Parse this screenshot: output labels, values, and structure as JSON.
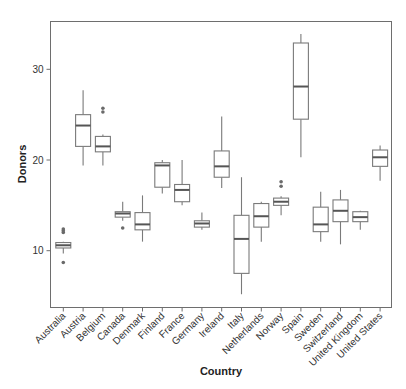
{
  "chart_data": {
    "type": "box",
    "title": "",
    "xlabel": "Country",
    "ylabel": "Donors",
    "ylim": [
      3.5,
      35.2
    ],
    "yticks": [
      10,
      20,
      30
    ],
    "grid": false,
    "legend": null,
    "categories": [
      "Australia",
      "Austria",
      "Belgium",
      "Canada",
      "Denmark",
      "Finland",
      "France",
      "Germany",
      "Ireland",
      "Italy",
      "Netherlands",
      "Norway",
      "Spain",
      "Sweden",
      "Switzerland",
      "United Kingdom",
      "United States"
    ],
    "boxes": [
      {
        "category": "Australia",
        "whisker_low": 9.7,
        "q1": 10.3,
        "median": 10.6,
        "q3": 10.9,
        "whisker_high": 11.0,
        "outliers": [
          8.7,
          12.0,
          12.2,
          12.4
        ]
      },
      {
        "category": "Austria",
        "whisker_low": 19.4,
        "q1": 21.5,
        "median": 23.8,
        "q3": 25.0,
        "whisker_high": 27.7,
        "outliers": []
      },
      {
        "category": "Belgium",
        "whisker_low": 19.4,
        "q1": 20.9,
        "median": 21.5,
        "q3": 22.6,
        "whisker_high": 22.8,
        "outliers": [
          25.3,
          25.7
        ]
      },
      {
        "category": "Canada",
        "whisker_low": 13.3,
        "q1": 13.7,
        "median": 14.1,
        "q3": 14.3,
        "whisker_high": 15.4,
        "outliers": [
          12.5
        ]
      },
      {
        "category": "Denmark",
        "whisker_low": 11.0,
        "q1": 12.3,
        "median": 12.9,
        "q3": 14.2,
        "whisker_high": 16.1,
        "outliers": []
      },
      {
        "category": "Finland",
        "whisker_low": 16.3,
        "q1": 17.0,
        "median": 19.4,
        "q3": 19.7,
        "whisker_high": 20.0,
        "outliers": []
      },
      {
        "category": "France",
        "whisker_low": 15.0,
        "q1": 15.4,
        "median": 16.7,
        "q3": 17.3,
        "whisker_high": 20.0,
        "outliers": []
      },
      {
        "category": "Germany",
        "whisker_low": 12.3,
        "q1": 12.6,
        "median": 13.0,
        "q3": 13.3,
        "whisker_high": 14.2,
        "outliers": []
      },
      {
        "category": "Ireland",
        "whisker_low": 16.9,
        "q1": 18.1,
        "median": 19.3,
        "q3": 21.0,
        "whisker_high": 24.8,
        "outliers": []
      },
      {
        "category": "Italy",
        "whisker_low": 5.2,
        "q1": 7.5,
        "median": 11.3,
        "q3": 13.9,
        "whisker_high": 18.1,
        "outliers": []
      },
      {
        "category": "Netherlands",
        "whisker_low": 11.0,
        "q1": 12.6,
        "median": 13.8,
        "q3": 15.2,
        "whisker_high": 15.4,
        "outliers": []
      },
      {
        "category": "Norway",
        "whisker_low": 13.9,
        "q1": 15.0,
        "median": 15.4,
        "q3": 15.8,
        "whisker_high": 16.0,
        "outliers": [
          17.1,
          17.6
        ]
      },
      {
        "category": "Spain",
        "whisker_low": 20.3,
        "q1": 24.5,
        "median": 28.1,
        "q3": 32.9,
        "whisker_high": 33.9,
        "outliers": []
      },
      {
        "category": "Sweden",
        "whisker_low": 11.0,
        "q1": 12.1,
        "median": 12.9,
        "q3": 14.8,
        "whisker_high": 16.5,
        "outliers": []
      },
      {
        "category": "Switzerland",
        "whisker_low": 10.7,
        "q1": 13.2,
        "median": 14.4,
        "q3": 15.6,
        "whisker_high": 16.7,
        "outliers": []
      },
      {
        "category": "United Kingdom",
        "whisker_low": 12.3,
        "q1": 13.2,
        "median": 13.7,
        "q3": 14.3,
        "whisker_high": 14.4,
        "outliers": []
      },
      {
        "category": "United States",
        "whisker_low": 17.7,
        "q1": 19.3,
        "median": 20.3,
        "q3": 21.1,
        "whisker_high": 21.6,
        "outliers": []
      }
    ],
    "colors": {
      "frame": "#6e6e6e",
      "box_stroke": "#7a7a7a",
      "median": "#555555",
      "outlier": "#6a6a6a",
      "background": "#ffffff"
    }
  }
}
